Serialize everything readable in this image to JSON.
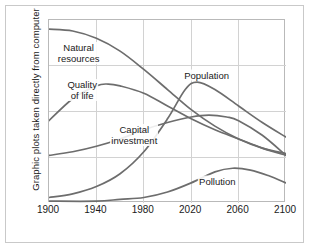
{
  "figure": {
    "y_axis_title": "Graphic plots taken directly from computer",
    "background_color": "#ffffff",
    "frame_color": "#c9c9c9",
    "plot_border_color": "#b9b9b9",
    "grid_color": "#d2d2d2",
    "curve_color": "#6d6d6d",
    "text_color": "#1a1a1a"
  },
  "chart_data": {
    "type": "line",
    "title": "",
    "subtitle": "",
    "xlabel": "",
    "ylabel": "Graphic plots taken directly from computer",
    "xlim": [
      1900,
      2100
    ],
    "ylim": [
      0,
      100
    ],
    "grid": true,
    "legend_position": "inline-labels",
    "x_ticks": [
      1900,
      1940,
      1980,
      2020,
      2060,
      2100
    ],
    "x_tick_labels": [
      "1900",
      "1940",
      "1980",
      "2020",
      "2060",
      "2100"
    ],
    "y_ticks": [
      25,
      50,
      75
    ],
    "y_tick_labels": [
      "",
      "",
      ""
    ],
    "annotations": [
      {
        "text": "Natural\nresources",
        "x": 1925,
        "y": 82
      },
      {
        "text": "Quality\nof life",
        "x": 1928,
        "y": 62
      },
      {
        "text": "Capital\ninvestment",
        "x": 1972,
        "y": 37
      },
      {
        "text": "Population",
        "x": 2033,
        "y": 70
      },
      {
        "text": "Pollution",
        "x": 2042,
        "y": 12
      }
    ],
    "series": [
      {
        "name": "Natural resources",
        "label": "Natural\nresources",
        "x": [
          1900,
          1920,
          1940,
          1960,
          1980,
          2000,
          2020,
          2040,
          2060,
          2080,
          2100
        ],
        "values": [
          95,
          94,
          90,
          83,
          73,
          62,
          51,
          42,
          35,
          30,
          27
        ]
      },
      {
        "name": "Quality of life",
        "label": "Quality\nof life",
        "x": [
          1900,
          1920,
          1940,
          1950,
          1960,
          1980,
          2000,
          2020,
          2040,
          2060,
          2080,
          2100
        ],
        "values": [
          45,
          57,
          64,
          65,
          64,
          60,
          53,
          46,
          40,
          35,
          30,
          26
        ]
      },
      {
        "name": "Capital investment",
        "label": "Capital\ninvestment",
        "x": [
          1900,
          1920,
          1940,
          1960,
          1980,
          2000,
          2020,
          2035,
          2050,
          2060,
          2080,
          2100
        ],
        "values": [
          26,
          28,
          31,
          35,
          40,
          44,
          47,
          48,
          47,
          45,
          37,
          26
        ]
      },
      {
        "name": "Population",
        "label": "Population",
        "x": [
          1900,
          1920,
          1940,
          1960,
          1980,
          2000,
          2015,
          2025,
          2040,
          2060,
          2080,
          2100
        ],
        "values": [
          3,
          5,
          9,
          16,
          28,
          46,
          62,
          66,
          62,
          53,
          44,
          36
        ]
      },
      {
        "name": "Pollution",
        "label": "Pollution",
        "x": [
          1900,
          1940,
          1960,
          1980,
          2000,
          2020,
          2040,
          2055,
          2070,
          2085,
          2100
        ],
        "values": [
          1,
          1,
          2,
          3,
          6,
          11,
          17,
          19,
          18,
          15,
          11
        ]
      }
    ]
  }
}
